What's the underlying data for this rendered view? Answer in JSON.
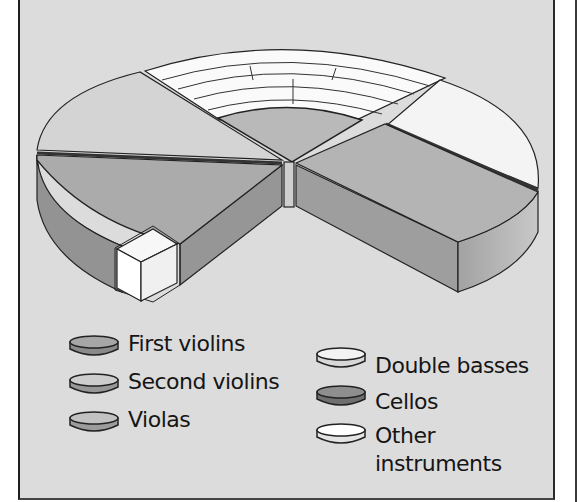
{
  "diagram": {
    "title": "",
    "type": "3D pie / orchestra seating layout",
    "sections": [
      {
        "name": "Second violins",
        "position": "left-back",
        "color": "#cfcfcf"
      },
      {
        "name": "First violins",
        "position": "left-front",
        "color": "#a9a9a9"
      },
      {
        "name": "Violas",
        "position": "center",
        "color": "#b8b8b8"
      },
      {
        "name": "Cellos",
        "position": "right-front",
        "color": "#b3b3b3"
      },
      {
        "name": "Double basses",
        "position": "right-back",
        "color": "#f2f2f2"
      },
      {
        "name": "Other instruments",
        "position": "back arc rows + front block",
        "color": "#ffffff"
      }
    ]
  },
  "legend": {
    "items": [
      {
        "label": "First violins",
        "top": "#a6a6a6",
        "side": "#8a8a8a"
      },
      {
        "label": "Second violins",
        "top": "#cdcdcd",
        "side": "#979797"
      },
      {
        "label": "Violas",
        "top": "#c2c2c2",
        "side": "#9c9c9c"
      },
      {
        "label": "Double basses",
        "top": "#f3f3f3",
        "side": "#d8d8d8"
      },
      {
        "label": "Cellos",
        "top": "#8e8e8e",
        "side": "#6f6f6f"
      },
      {
        "label": "Other instruments",
        "top": "#ffffff",
        "side": "#e4e4e4"
      }
    ]
  },
  "colors": {
    "background": "#dcdcdc",
    "outline": "#1e1e1e"
  }
}
